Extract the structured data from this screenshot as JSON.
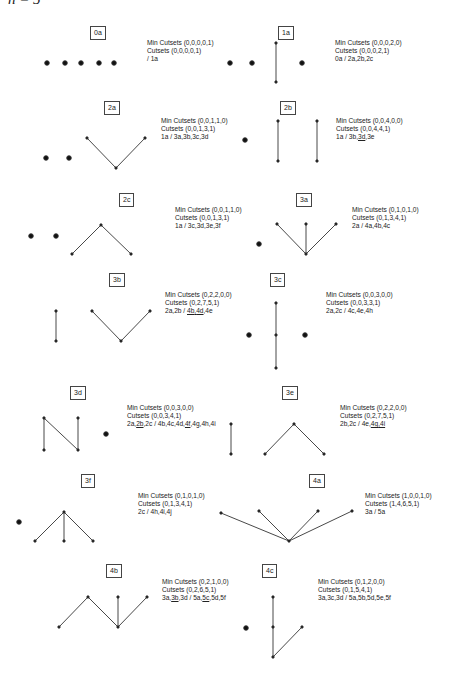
{
  "header": {
    "text": "n = 5"
  },
  "graphs": [
    {
      "id": "0a",
      "label": "0a",
      "min_cutsets": "Min Cutsets (0,0,0,0,1)",
      "cutsets": "Cutsets (0,0,0,0,1)",
      "relations": " / 1a"
    },
    {
      "id": "1a",
      "label": "1a",
      "min_cutsets": "Min Cutsets (0,0,0,2,0)",
      "cutsets": "Cutsets (0,0,0,2,1)",
      "relations": "0a / 2a,2b,2c"
    },
    {
      "id": "2a",
      "label": "2a",
      "min_cutsets": "Min Cutsets (0,0,1,1,0)",
      "cutsets": "Cutsets (0,0,1,3,1)",
      "relations": "1a / 3a,3b,3c,3d"
    },
    {
      "id": "2b",
      "label": "2b",
      "min_cutsets": "Min Cutsets (0,0,4,0,0)",
      "cutsets": "Cutsets (0,0,4,4,1)",
      "relations_parts": [
        "1a / 3b,",
        "3d",
        ",3e"
      ]
    },
    {
      "id": "2c",
      "label": "2c",
      "min_cutsets": "Min Cutsets (0,0,1,1,0)",
      "cutsets": "Cutsets (0,0,1,3,1)",
      "relations": "1a / 3c,3d,3e,3f"
    },
    {
      "id": "3a",
      "label": "3a",
      "min_cutsets": "Min Cutsets (0,1,0,1,0)",
      "cutsets": "Cutsets (0,1,3,4,1)",
      "relations": "2a / 4a,4b,4c"
    },
    {
      "id": "3b",
      "label": "3b",
      "min_cutsets": "Min Cutsets (0,2,2,0,0)",
      "cutsets": "Cutsets (0,2,7,5,1)",
      "relations_parts": [
        "2a,2b / ",
        "4b",
        ",",
        "4d",
        ",4e"
      ]
    },
    {
      "id": "3c",
      "label": "3c",
      "min_cutsets": "Min Cutsets (0,0,3,0,0)",
      "cutsets": "Cutsets (0,0,3,3,1)",
      "relations": "2a,2c / 4c,4e,4h"
    },
    {
      "id": "3d",
      "label": "3d",
      "min_cutsets": "Min Cutsets (0,0,3,0,0)",
      "cutsets": "Cutsets (0,0,3,4,1)",
      "relations_parts": [
        "2a,",
        "2b",
        ",2c / 4b,4c,4d,",
        "4f",
        ",4g,4h,4i"
      ]
    },
    {
      "id": "3e",
      "label": "3e",
      "min_cutsets": "Min Cutsets (0,2,2,0,0)",
      "cutsets": "Cutsets (0,2,7,5,1)",
      "relations_parts": [
        "2b,2c / 4e,",
        "4g",
        ",",
        "4i"
      ]
    },
    {
      "id": "3f",
      "label": "3f",
      "min_cutsets": "Min Cutsets (0,1,0,1,0)",
      "cutsets": "Cutsets (0,1,3,4,1)",
      "relations": "2c / 4h,4i,4j"
    },
    {
      "id": "4a",
      "label": "4a",
      "min_cutsets": "Min Cutsets (1,0,0,1,0)",
      "cutsets": "Cutsets (1,4,6,5,1)",
      "relations": "3a / 5a"
    },
    {
      "id": "4b",
      "label": "4b",
      "min_cutsets": "Min Cutsets (0,2,1,0,0)",
      "cutsets": "Cutsets (0,2,6,5,1)",
      "relations_parts": [
        "3a,",
        "3b",
        ",3d / 5a,",
        "5c",
        ",5d,5f"
      ]
    },
    {
      "id": "4c",
      "label": "4c",
      "min_cutsets": "Min Cutsets (0,1,2,0,0)",
      "cutsets": "Cutsets (0,1,5,4,1)",
      "relations": "3a,3c,3d / 5a,5b,5d,5e,5f"
    }
  ],
  "colors": {
    "edge": "#333333",
    "vertex": "#111111",
    "box_border": "#444444",
    "text": "#222222"
  }
}
